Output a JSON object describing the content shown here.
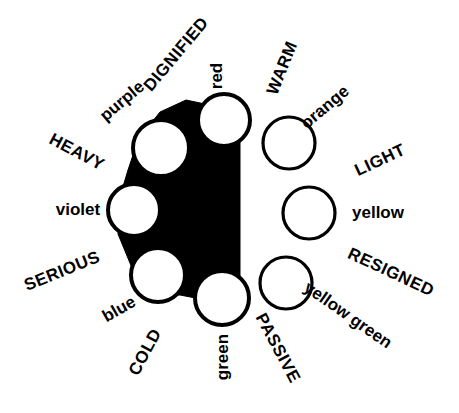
{
  "figure": {
    "background_color": "#ffffff",
    "ink_color": "#000000"
  },
  "chart_data": {
    "type": "scatter",
    "xlabel": "",
    "ylabel": "",
    "grid": false,
    "legend": "none",
    "categories": [
      "red",
      "orange",
      "yellow",
      "yellow green",
      "green",
      "blue",
      "violet",
      "purple"
    ],
    "values": [
      1,
      1,
      1,
      1,
      1,
      1,
      1,
      1
    ],
    "annotations": [
      "DIGNIFIED",
      "WARM",
      "LIGHT",
      "RESIGNED",
      "PASSIVE",
      "COLD",
      "SERIOUS",
      "HEAVY"
    ]
  },
  "hues": [
    {
      "name": "red",
      "label": "red",
      "x": 224,
      "y": 120,
      "r": 26,
      "filled_backing": true,
      "rotation": -90,
      "label_x": 216,
      "label_y": 76
    },
    {
      "name": "orange",
      "label": "orange",
      "x": 289,
      "y": 143,
      "r": 26,
      "filled_backing": false,
      "rotation": -40,
      "label_x": 325,
      "label_y": 107
    },
    {
      "name": "yellow",
      "label": "yellow",
      "x": 309,
      "y": 213,
      "r": 26,
      "filled_backing": false,
      "rotation": 0,
      "label_x": 378,
      "label_y": 212
    },
    {
      "name": "yellow-green",
      "label": "yellow green",
      "x": 286,
      "y": 283,
      "r": 26,
      "filled_backing": false,
      "rotation": 35,
      "label_x": 348,
      "label_y": 315
    },
    {
      "name": "green",
      "label": "green",
      "x": 222,
      "y": 298,
      "r": 27,
      "filled_backing": true,
      "rotation": -90,
      "label_x": 222,
      "label_y": 357
    },
    {
      "name": "blue",
      "label": "blue",
      "x": 158,
      "y": 275,
      "r": 27,
      "filled_backing": true,
      "rotation": -30,
      "label_x": 119,
      "label_y": 309
    },
    {
      "name": "violet",
      "label": "violet",
      "x": 134,
      "y": 210,
      "r": 26,
      "filled_backing": true,
      "rotation": 0,
      "label_x": 78,
      "label_y": 209
    },
    {
      "name": "purple",
      "label": "purple",
      "x": 161,
      "y": 148,
      "r": 28,
      "filled_backing": true,
      "rotation": -40,
      "label_x": 122,
      "label_y": 101
    }
  ],
  "moods": [
    {
      "name": "dignified",
      "label": "DIGNIFIED",
      "x": 176,
      "y": 54,
      "rotation": -50
    },
    {
      "name": "warm",
      "label": "WARM",
      "x": 282,
      "y": 68,
      "rotation": -68
    },
    {
      "name": "light",
      "label": "LIGHT",
      "x": 380,
      "y": 160,
      "rotation": -25
    },
    {
      "name": "resigned",
      "label": "RESIGNED",
      "x": 391,
      "y": 272,
      "rotation": 25
    },
    {
      "name": "passive",
      "label": "PASSIVE",
      "x": 278,
      "y": 348,
      "rotation": 62
    },
    {
      "name": "cold",
      "label": "COLD",
      "x": 145,
      "y": 352,
      "rotation": -62
    },
    {
      "name": "serious",
      "label": "SERIOUS",
      "x": 62,
      "y": 271,
      "rotation": -22
    },
    {
      "name": "heavy",
      "label": "HEAVY",
      "x": 77,
      "y": 152,
      "rotation": 28
    }
  ],
  "blob": {
    "name": "black-backing-shape",
    "path": "M 205 104 L 240 116 L 240 292 L 206 300 L 180 295 L 150 295 L 132 268 L 118 234 L 119 200 L 128 170 L 138 140 L 160 112 L 186 100 Z"
  }
}
